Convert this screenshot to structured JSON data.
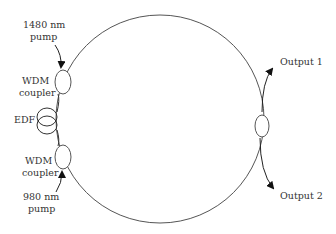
{
  "diagram": {
    "type": "fiber-ring-laser",
    "labels": {
      "pump_1480_line1": "1480 nm",
      "pump_1480_line2": "pump",
      "wdm_top_line1": "WDM",
      "wdm_top_line2": "coupler",
      "edf": "EDF",
      "wdm_bottom_line1": "WDM",
      "wdm_bottom_line2": "coupler",
      "pump_980_line1": "980 nm",
      "pump_980_line2": "pump",
      "output1": "Output 1",
      "output2": "Output 2"
    },
    "components": [
      {
        "name": "ring",
        "shape": "circle"
      },
      {
        "name": "wdm-coupler-top",
        "shape": "ellipse"
      },
      {
        "name": "edf-coil",
        "shape": "double-loop"
      },
      {
        "name": "wdm-coupler-bottom",
        "shape": "ellipse"
      },
      {
        "name": "output-coupler",
        "shape": "ellipse"
      }
    ],
    "colors": {
      "stroke": "#555555",
      "arrow": "#111111",
      "text": "#333333"
    }
  }
}
